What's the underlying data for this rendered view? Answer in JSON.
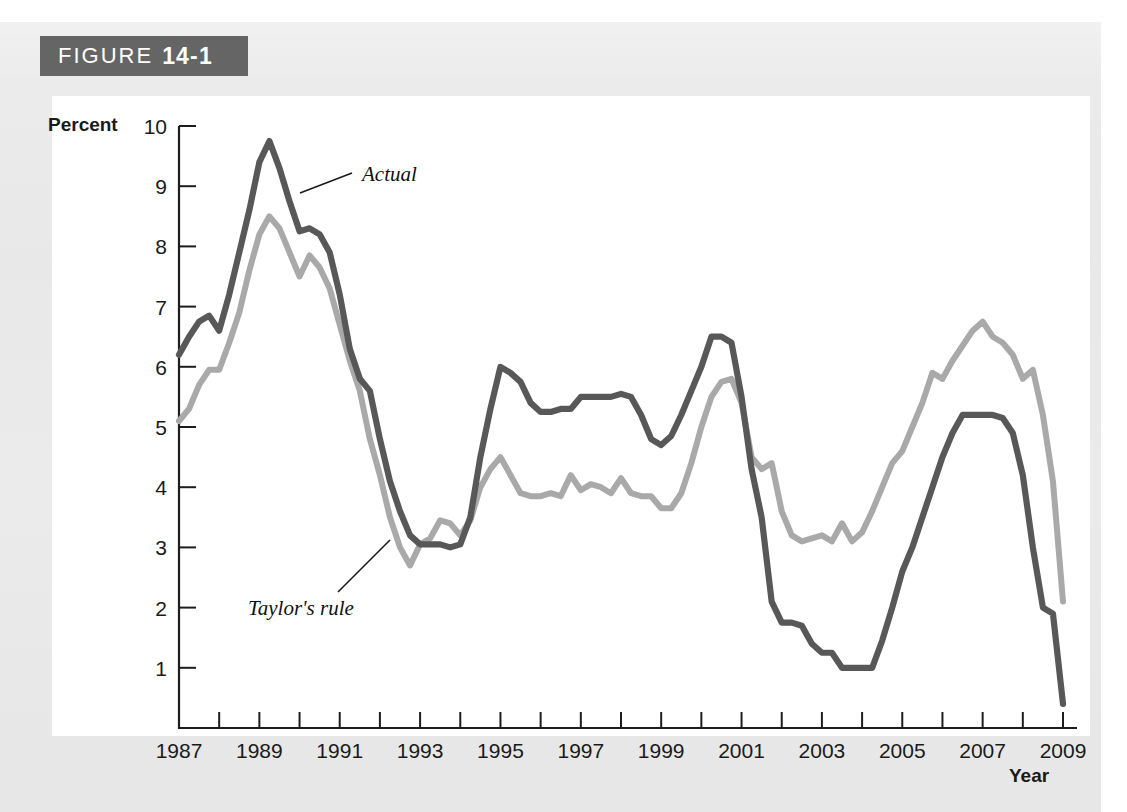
{
  "figure": {
    "label": "FIGURE",
    "number": "14-1",
    "banner_color": "#656565"
  },
  "axis": {
    "ylabel": "Percent",
    "xlabel": "Year"
  },
  "annotations": {
    "actual": "Actual",
    "taylor": "Taylor's rule"
  },
  "colors": {
    "actual_line": "#585858",
    "taylor_line": "#a9a9a9",
    "page_background": "#ebebeb",
    "plot_background": "#ffffff",
    "axis": "#1d1d1d"
  },
  "chart_data": {
    "type": "line",
    "title": "FIGURE 14-1",
    "xlabel": "Year",
    "ylabel": "Percent",
    "xlim": [
      1987,
      2009
    ],
    "ylim": [
      0,
      10
    ],
    "yticks": [
      1,
      2,
      3,
      4,
      5,
      6,
      7,
      8,
      9,
      10
    ],
    "ytick_labels": [
      "1",
      "2",
      "3",
      "4",
      "5",
      "6",
      "7",
      "8",
      "9",
      "10"
    ],
    "xticks": [
      1987,
      1988,
      1989,
      1990,
      1991,
      1992,
      1993,
      1994,
      1995,
      1996,
      1997,
      1998,
      1999,
      2000,
      2001,
      2002,
      2003,
      2004,
      2005,
      2006,
      2007,
      2008,
      2009
    ],
    "xtick_labels_shown": [
      "1987",
      "1989",
      "1991",
      "1993",
      "1995",
      "1997",
      "1999",
      "2001",
      "2003",
      "2005",
      "2007",
      "2009"
    ],
    "grid": false,
    "legend": "inline-annotations",
    "x": [
      1987.0,
      1987.25,
      1987.5,
      1987.75,
      1988.0,
      1988.25,
      1988.5,
      1988.75,
      1989.0,
      1989.25,
      1989.5,
      1989.75,
      1990.0,
      1990.25,
      1990.5,
      1990.75,
      1991.0,
      1991.25,
      1991.5,
      1991.75,
      1992.0,
      1992.25,
      1992.5,
      1992.75,
      1993.0,
      1993.25,
      1993.5,
      1993.75,
      1994.0,
      1994.25,
      1994.5,
      1994.75,
      1995.0,
      1995.25,
      1995.5,
      1995.75,
      1996.0,
      1996.25,
      1996.5,
      1996.75,
      1997.0,
      1997.25,
      1997.5,
      1997.75,
      1998.0,
      1998.25,
      1998.5,
      1998.75,
      1999.0,
      1999.25,
      1999.5,
      1999.75,
      2000.0,
      2000.25,
      2000.5,
      2000.75,
      2001.0,
      2001.25,
      2001.5,
      2001.75,
      2002.0,
      2002.25,
      2002.5,
      2002.75,
      2003.0,
      2003.25,
      2003.5,
      2003.75,
      2004.0,
      2004.25,
      2004.5,
      2004.75,
      2005.0,
      2005.25,
      2005.5,
      2005.75,
      2006.0,
      2006.25,
      2006.5,
      2006.75,
      2007.0,
      2007.25,
      2007.5,
      2007.75,
      2008.0,
      2008.25,
      2008.5,
      2008.75,
      2009.0
    ],
    "series": [
      {
        "name": "Actual",
        "color": "#585858",
        "values": [
          6.2,
          6.5,
          6.75,
          6.85,
          6.6,
          7.2,
          7.9,
          8.6,
          9.4,
          9.75,
          9.3,
          8.75,
          8.25,
          8.3,
          8.2,
          7.9,
          7.2,
          6.3,
          5.8,
          5.6,
          4.8,
          4.1,
          3.6,
          3.2,
          3.05,
          3.05,
          3.05,
          3.0,
          3.05,
          3.5,
          4.5,
          5.3,
          6.0,
          5.9,
          5.75,
          5.4,
          5.25,
          5.25,
          5.3,
          5.3,
          5.5,
          5.5,
          5.5,
          5.5,
          5.55,
          5.5,
          5.2,
          4.8,
          4.7,
          4.85,
          5.2,
          5.6,
          6.0,
          6.5,
          6.5,
          6.4,
          5.5,
          4.3,
          3.5,
          2.1,
          1.75,
          1.75,
          1.7,
          1.4,
          1.25,
          1.25,
          1.0,
          1.0,
          1.0,
          1.0,
          1.45,
          2.0,
          2.6,
          3.0,
          3.5,
          4.0,
          4.5,
          4.9,
          5.2,
          5.2,
          5.2,
          5.2,
          5.15,
          4.9,
          4.2,
          3.0,
          2.0,
          1.9,
          0.4
        ]
      },
      {
        "name": "Taylor's rule",
        "color": "#a9a9a9",
        "values": [
          5.1,
          5.3,
          5.7,
          5.95,
          5.95,
          6.4,
          6.9,
          7.6,
          8.2,
          8.5,
          8.3,
          7.9,
          7.5,
          7.85,
          7.65,
          7.3,
          6.7,
          6.1,
          5.6,
          4.8,
          4.2,
          3.5,
          3.0,
          2.7,
          3.05,
          3.15,
          3.45,
          3.4,
          3.2,
          3.45,
          4.0,
          4.3,
          4.5,
          4.2,
          3.9,
          3.85,
          3.85,
          3.9,
          3.85,
          4.2,
          3.95,
          4.05,
          4.0,
          3.9,
          4.15,
          3.9,
          3.85,
          3.85,
          3.65,
          3.65,
          3.9,
          4.4,
          5.0,
          5.5,
          5.75,
          5.8,
          5.4,
          4.5,
          4.3,
          4.4,
          3.6,
          3.2,
          3.1,
          3.15,
          3.2,
          3.1,
          3.4,
          3.1,
          3.25,
          3.6,
          4.0,
          4.4,
          4.6,
          5.0,
          5.4,
          5.9,
          5.8,
          6.1,
          6.35,
          6.6,
          6.75,
          6.5,
          6.4,
          6.2,
          5.8,
          5.95,
          5.2,
          4.1,
          2.1
        ]
      }
    ]
  }
}
